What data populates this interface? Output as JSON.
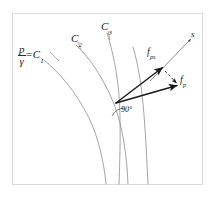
{
  "figure": {
    "background_color": "#ffffff",
    "frame": {
      "name": "figure-border",
      "color": "#d8d8d8",
      "x": 12,
      "y": 13,
      "width": 191,
      "height": 172
    },
    "curve_color": "#8a8a8a",
    "vector_color": "#1a1a1a",
    "text_color": "#1a1a1a"
  },
  "labels": {
    "c1": {
      "numerator": "p",
      "denominator": "γ",
      "equals": "=",
      "name": "C",
      "subscript": "1"
    },
    "c2": {
      "name": "C",
      "subscript": "2"
    },
    "c3": {
      "name": "C",
      "subscript": "3"
    },
    "f_ps": {
      "name": "f",
      "subscript": "ps"
    },
    "f_p": {
      "name": "f",
      "subscript": "p"
    },
    "s": {
      "name": "s"
    },
    "angle": {
      "text": "90°"
    }
  },
  "geometry": {
    "vertex": {
      "x": 116,
      "y": 103
    },
    "vectors": [
      {
        "id": "f-ps-vector",
        "label": "f_ps",
        "from": [
          116,
          103
        ],
        "to": [
          163,
          68
        ],
        "style": "solid-arrow"
      },
      {
        "id": "f-p-vector",
        "label": "f_p",
        "from": [
          116,
          103
        ],
        "to": [
          178,
          86
        ],
        "style": "solid-arrow"
      },
      {
        "id": "component-connector",
        "label": "",
        "from": [
          164,
          70
        ],
        "to": [
          177,
          84
        ],
        "style": "dashed-arrow"
      },
      {
        "id": "s-axis",
        "label": "s",
        "from": [
          150,
          81
        ],
        "to": [
          192,
          38
        ],
        "style": "thin-arrow"
      }
    ],
    "curves": [
      {
        "id": "curve-c1",
        "label": "C1"
      },
      {
        "id": "curve-c2",
        "label": "C2"
      },
      {
        "id": "curve-c3",
        "label": "C3"
      },
      {
        "id": "curve-c4",
        "label": ""
      }
    ]
  }
}
